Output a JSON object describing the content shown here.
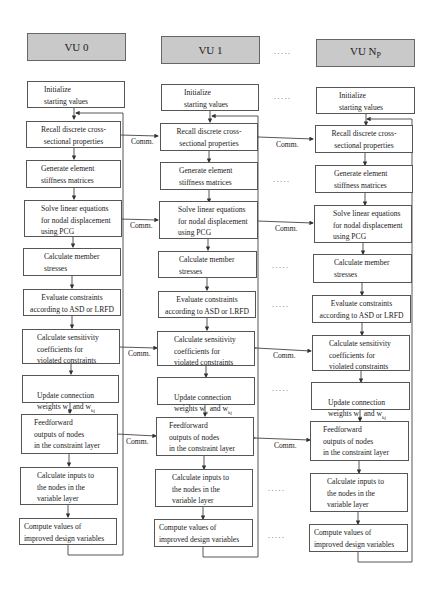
{
  "columns": [
    {
      "header": "VU 0"
    },
    {
      "header": "VU 1"
    },
    {
      "header_main": "VU N",
      "header_sub": "P"
    }
  ],
  "ellipsis": ".....",
  "comm_label": "Comm.",
  "steps": {
    "initialize": "Initialize\nstarting values",
    "recall": "Recall  discrete cross-\nsectional properties",
    "generate": "Generate element\nstiffness matrices",
    "solve": "Solve linear equations\nfor nodal displacement\nusing PCG",
    "stresses": "Calculate member\nstresses",
    "evaluate": "Evaluate constraints\naccording to ASD or LRFD",
    "sensitivity": "Calculate sensitivity\ncoefficients for\nviolated constraints",
    "update_prefix": "Update connection",
    "update_line2a": "weights w",
    "update_sub1": "ji",
    "update_line2b": " and w",
    "update_sub2": "kj",
    "feedforward": "Feedforward\noutputs of nodes\nin the constraint layer",
    "inputs": "Calculate inputs to\nthe nodes in the\nvariable layer",
    "compute": "Compute values of\nimproved design variables"
  }
}
